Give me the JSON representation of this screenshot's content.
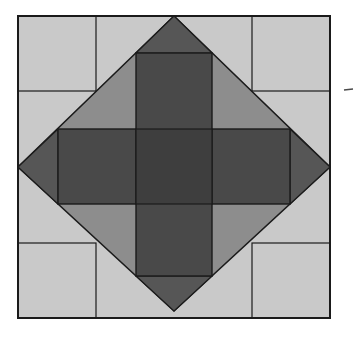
{
  "figure": {
    "canvas": {
      "width": 355,
      "height": 338,
      "background": "#ffffff"
    },
    "palette": {
      "square_fill": "#c9c9c9",
      "diamond_fill": "#8d8d8d",
      "tip_fill": "#565656",
      "rectangle_fill": "#494949",
      "overlap_fill": "#3e3e3e",
      "outline": "#1b1b1b"
    },
    "shapes": [
      {
        "name": "outer-square",
        "type": "rect",
        "x": 18,
        "y": 16,
        "w": 312,
        "h": 302,
        "fill": "#c9c9c9",
        "stroke": "#1b1b1b",
        "strokeWidth": 2
      },
      {
        "name": "corner-cell-top-left",
        "type": "rect",
        "x": 18,
        "y": 16,
        "w": 78,
        "h": 75,
        "fill": "none",
        "stroke": "#1b1b1b",
        "strokeWidth": 1.2
      },
      {
        "name": "corner-cell-top-right",
        "type": "rect",
        "x": 252,
        "y": 16,
        "w": 78,
        "h": 75,
        "fill": "none",
        "stroke": "#1b1b1b",
        "strokeWidth": 1.2
      },
      {
        "name": "corner-cell-bottom-left",
        "type": "rect",
        "x": 18,
        "y": 243,
        "w": 78,
        "h": 75,
        "fill": "none",
        "stroke": "#1b1b1b",
        "strokeWidth": 1.2
      },
      {
        "name": "corner-cell-bottom-right",
        "type": "rect",
        "x": 252,
        "y": 243,
        "w": 78,
        "h": 75,
        "fill": "none",
        "stroke": "#1b1b1b",
        "strokeWidth": 1.2
      },
      {
        "name": "diamond",
        "type": "polygon",
        "points": "174,16 330,167 174,311 18,167",
        "fill": "#8d8d8d",
        "stroke": "#1b1b1b",
        "strokeWidth": 1.6
      },
      {
        "name": "diamond-tip-top",
        "type": "polygon",
        "points": "174,16 136,53 212,53",
        "fill": "#565656",
        "stroke": "#1b1b1b",
        "strokeWidth": 1.1
      },
      {
        "name": "diamond-tip-right",
        "type": "polygon",
        "points": "330,167 290,129 290,204",
        "fill": "#565656",
        "stroke": "#1b1b1b",
        "strokeWidth": 1.1
      },
      {
        "name": "diamond-tip-bottom",
        "type": "polygon",
        "points": "174,311 212,276 136,276",
        "fill": "#565656",
        "stroke": "#1b1b1b",
        "strokeWidth": 1.1
      },
      {
        "name": "diamond-tip-left",
        "type": "polygon",
        "points": "18,167 58,204 58,129",
        "fill": "#565656",
        "stroke": "#1b1b1b",
        "strokeWidth": 1.1
      },
      {
        "name": "horizontal-rectangle",
        "type": "rect",
        "x": 58,
        "y": 129,
        "w": 232,
        "h": 75,
        "fill": "#494949",
        "stroke": "#1b1b1b",
        "strokeWidth": 1.4
      },
      {
        "name": "vertical-rectangle",
        "type": "rect",
        "x": 136,
        "y": 53,
        "w": 76,
        "h": 223,
        "fill": "#494949",
        "stroke": "#1b1b1b",
        "strokeWidth": 1.4
      },
      {
        "name": "center-overlap",
        "type": "rect",
        "x": 136,
        "y": 129,
        "w": 76,
        "h": 75,
        "fill": "#3e3e3e",
        "stroke": "#1b1b1b",
        "strokeWidth": 1.2
      },
      {
        "name": "stray-mark",
        "type": "line",
        "x1": 344,
        "y1": 90,
        "x2": 353,
        "y2": 89,
        "fill": "none",
        "stroke": "#4a4a4a",
        "strokeWidth": 1.5
      }
    ]
  }
}
